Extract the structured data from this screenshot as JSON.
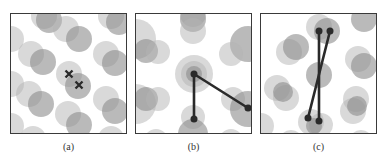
{
  "figure": {
    "panels": [
      {
        "id": "a",
        "caption": "(a)",
        "circles": [
          {
            "cx": 33,
            "cy": 2,
            "r": 13,
            "shade": "light"
          },
          {
            "cx": 38,
            "cy": 6,
            "r": 13,
            "shade": "dark"
          },
          {
            "cx": 55,
            "cy": 15,
            "r": 13,
            "shade": "light"
          },
          {
            "cx": 68,
            "cy": 25,
            "r": 13,
            "shade": "dark"
          },
          {
            "cx": 100,
            "cy": 2,
            "r": 13,
            "shade": "light"
          },
          {
            "cx": 108,
            "cy": 8,
            "r": 13,
            "shade": "dark"
          },
          {
            "cx": 0,
            "cy": 25,
            "r": 13,
            "shade": "light"
          },
          {
            "cx": 20,
            "cy": 40,
            "r": 13,
            "shade": "light"
          },
          {
            "cx": 32,
            "cy": 48,
            "r": 13,
            "shade": "dark"
          },
          {
            "cx": 58,
            "cy": 60,
            "r": 13,
            "shade": "light"
          },
          {
            "cx": 67,
            "cy": 72,
            "r": 13,
            "shade": "dark"
          },
          {
            "cx": 95,
            "cy": 40,
            "r": 13,
            "shade": "light"
          },
          {
            "cx": 104,
            "cy": 49,
            "r": 13,
            "shade": "dark"
          },
          {
            "cx": 0,
            "cy": 70,
            "r": 13,
            "shade": "light"
          },
          {
            "cx": 18,
            "cy": 80,
            "r": 13,
            "shade": "light"
          },
          {
            "cx": 30,
            "cy": 90,
            "r": 13,
            "shade": "dark"
          },
          {
            "cx": 95,
            "cy": 85,
            "r": 13,
            "shade": "light"
          },
          {
            "cx": 104,
            "cy": 97,
            "r": 13,
            "shade": "dark"
          },
          {
            "cx": 57,
            "cy": 100,
            "r": 13,
            "shade": "light"
          },
          {
            "cx": 68,
            "cy": 111,
            "r": 13,
            "shade": "dark"
          },
          {
            "cx": 0,
            "cy": 112,
            "r": 13,
            "shade": "light"
          },
          {
            "cx": 22,
            "cy": 125,
            "r": 13,
            "shade": "light"
          },
          {
            "cx": 100,
            "cy": 125,
            "r": 13,
            "shade": "light"
          }
        ],
        "markers": [
          {
            "type": "cross",
            "x": 58,
            "y": 60
          },
          {
            "type": "cross",
            "x": 68,
            "y": 71
          }
        ],
        "lines": []
      },
      {
        "id": "b",
        "caption": "(b)",
        "circles": [
          {
            "cx": 57,
            "cy": 0,
            "r": 13,
            "shade": "light"
          },
          {
            "cx": 57,
            "cy": 5,
            "r": 13,
            "shade": "dark"
          },
          {
            "cx": 57,
            "cy": 17,
            "r": 13,
            "shade": "light"
          },
          {
            "cx": 0,
            "cy": 25,
            "r": 20,
            "shade": "light"
          },
          {
            "cx": 10,
            "cy": 37,
            "r": 12,
            "shade": "dark"
          },
          {
            "cx": 22,
            "cy": 38,
            "r": 12,
            "shade": "light"
          },
          {
            "cx": 112,
            "cy": 30,
            "r": 18,
            "shade": "dark"
          },
          {
            "cx": 95,
            "cy": 40,
            "r": 12,
            "shade": "light"
          },
          {
            "cx": 58,
            "cy": 60,
            "r": 19,
            "shade": "light"
          },
          {
            "cx": 58,
            "cy": 60,
            "r": 13,
            "shade": "light"
          },
          {
            "cx": 58,
            "cy": 60,
            "r": 8,
            "shade": "dark"
          },
          {
            "cx": 0,
            "cy": 90,
            "r": 20,
            "shade": "light"
          },
          {
            "cx": 10,
            "cy": 85,
            "r": 12,
            "shade": "dark"
          },
          {
            "cx": 22,
            "cy": 85,
            "r": 12,
            "shade": "light"
          },
          {
            "cx": 97,
            "cy": 85,
            "r": 12,
            "shade": "light"
          },
          {
            "cx": 112,
            "cy": 95,
            "r": 18,
            "shade": "dark"
          },
          {
            "cx": 57,
            "cy": 103,
            "r": 12,
            "shade": "light"
          },
          {
            "cx": 57,
            "cy": 120,
            "r": 15,
            "shade": "dark"
          },
          {
            "cx": 20,
            "cy": 127,
            "r": 12,
            "shade": "light"
          },
          {
            "cx": 95,
            "cy": 127,
            "r": 12,
            "shade": "light"
          }
        ],
        "markers": [
          {
            "type": "dot",
            "x": 58,
            "y": 60
          },
          {
            "type": "dot",
            "x": 112,
            "y": 94
          },
          {
            "type": "dot",
            "x": 58,
            "y": 105
          }
        ],
        "lines": [
          {
            "x1": 58,
            "y1": 60,
            "x2": 112,
            "y2": 94
          },
          {
            "x1": 58,
            "y1": 60,
            "x2": 58,
            "y2": 105
          }
        ]
      },
      {
        "id": "c",
        "caption": "(c)",
        "circles": [
          {
            "cx": 58,
            "cy": 13,
            "r": 13,
            "shade": "light"
          },
          {
            "cx": 66,
            "cy": 17,
            "r": 13,
            "shade": "dark"
          },
          {
            "cx": 28,
            "cy": 38,
            "r": 13,
            "shade": "light"
          },
          {
            "cx": 35,
            "cy": 33,
            "r": 13,
            "shade": "dark"
          },
          {
            "cx": 103,
            "cy": 5,
            "r": 13,
            "shade": "dark"
          },
          {
            "cx": 97,
            "cy": 45,
            "r": 13,
            "shade": "light"
          },
          {
            "cx": 103,
            "cy": 52,
            "r": 13,
            "shade": "dark"
          },
          {
            "cx": 58,
            "cy": 61,
            "r": 13,
            "shade": "dark"
          },
          {
            "cx": 16,
            "cy": 74,
            "r": 13,
            "shade": "light"
          },
          {
            "cx": 25,
            "cy": 84,
            "r": 13,
            "shade": "light"
          },
          {
            "cx": 22,
            "cy": 78,
            "r": 10,
            "shade": "dark"
          },
          {
            "cx": 95,
            "cy": 85,
            "r": 13,
            "shade": "light"
          },
          {
            "cx": 92,
            "cy": 97,
            "r": 13,
            "shade": "light"
          },
          {
            "cx": 96,
            "cy": 92,
            "r": 10,
            "shade": "dark"
          },
          {
            "cx": 50,
            "cy": 108,
            "r": 13,
            "shade": "light"
          },
          {
            "cx": 60,
            "cy": 111,
            "r": 12,
            "shade": "light"
          },
          {
            "cx": 53,
            "cy": 112,
            "r": 8,
            "shade": "dark"
          },
          {
            "cx": 0,
            "cy": 112,
            "r": 13,
            "shade": "light"
          },
          {
            "cx": 30,
            "cy": 128,
            "r": 12,
            "shade": "light"
          },
          {
            "cx": 100,
            "cy": 128,
            "r": 12,
            "shade": "light"
          }
        ],
        "markers": [
          {
            "type": "dot",
            "x": 58,
            "y": 17
          },
          {
            "type": "dot",
            "x": 69,
            "y": 17
          },
          {
            "type": "dot",
            "x": 47,
            "y": 104
          },
          {
            "type": "dot",
            "x": 58,
            "y": 107
          }
        ],
        "lines": [
          {
            "x1": 58,
            "y1": 17,
            "x2": 58,
            "y2": 107
          },
          {
            "x1": 69,
            "y1": 17,
            "x2": 47,
            "y2": 104
          }
        ]
      }
    ],
    "colors": {
      "light": "#b4b4b4",
      "dark": "#8c8c8c",
      "stroke": "#2a2a2a",
      "border": "#3a3a3a"
    }
  }
}
